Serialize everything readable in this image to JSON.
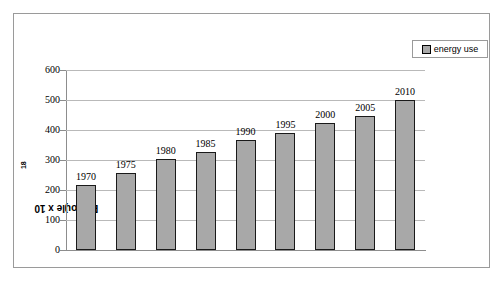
{
  "chart_data": {
    "type": "bar",
    "title": "",
    "xlabel": "",
    "ylabel": "EJ (joule x 10",
    "ylabel_sup": "18",
    "ylabel_suffix": ")",
    "categories": [
      "1970",
      "1975",
      "1980",
      "1985",
      "1990",
      "1995",
      "2000",
      "2005",
      "2010"
    ],
    "values": [
      217,
      257,
      302,
      327,
      368,
      390,
      422,
      448,
      500
    ],
    "point_labels": [
      "1970",
      "1975",
      "1980",
      "1985",
      "1990",
      "1995",
      "2000",
      "2005",
      "2010"
    ],
    "ylim": [
      0,
      600
    ],
    "yticks": [
      0,
      100,
      200,
      300,
      400,
      500,
      600
    ],
    "ytick_labels": [
      "0",
      "100",
      "200",
      "300",
      "400",
      "500",
      "600"
    ],
    "xtick_labels": [],
    "grid": true,
    "legend": {
      "position": "top-right",
      "entries": [
        {
          "label": "energy use",
          "color": "#a8a8a8",
          "marker": "square"
        }
      ]
    },
    "colors": {
      "bar_fill": "#a8a8a8",
      "bar_border": "#1a1a1a",
      "gridline": "#b9b9b9",
      "axis": "#8d8d8d",
      "frame": "#9a9a9a",
      "background": "#ffffff",
      "text": "#000000"
    }
  }
}
